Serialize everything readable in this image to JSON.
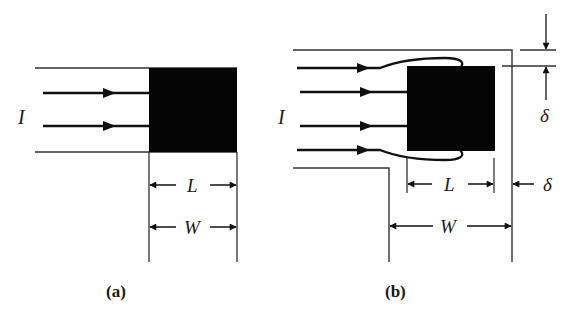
{
  "figure": {
    "panel_a": {
      "caption": "(a)",
      "current_label": "I",
      "length_label": "L",
      "width_label": "W",
      "arrow_count": 2
    },
    "panel_b": {
      "caption": "(b)",
      "current_label": "I",
      "length_label": "L",
      "width_label": "W",
      "delta_top_label": "δ",
      "delta_right_label": "δ",
      "arrow_count": 4
    },
    "colors": {
      "ink": "#111111",
      "line": "#333333",
      "background": "#ffffff"
    }
  }
}
